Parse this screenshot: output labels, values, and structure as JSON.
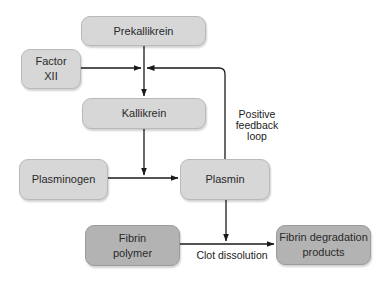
{
  "diagram": {
    "nodes": [
      {
        "id": "prekallikrein",
        "label": "Prekallikrein",
        "shade": "light"
      },
      {
        "id": "factor_xii",
        "label_line1": "Factor",
        "label_line2": "XII",
        "shade": "light"
      },
      {
        "id": "kallikrein",
        "label": "Kallikrein",
        "shade": "light"
      },
      {
        "id": "plasminogen",
        "label": "Plasminogen",
        "shade": "light"
      },
      {
        "id": "plasmin",
        "label": "Plasmin",
        "shade": "light"
      },
      {
        "id": "fibrin_polymer",
        "label_line1": "Fibrin",
        "label_line2": "polymer",
        "shade": "dark"
      },
      {
        "id": "fibrin_degradation",
        "label_line1": "Fibrin degradation",
        "label_line2": "products",
        "shade": "dark"
      }
    ],
    "edge_labels": {
      "feedback_line1": "Positive",
      "feedback_line2": "feedback",
      "feedback_line3": "loop",
      "clot_dissolution": "Clot dissolution"
    },
    "edges": [
      {
        "from": "prekallikrein",
        "to": "kallikrein"
      },
      {
        "from": "factor_xii",
        "to": "prekallikrein->kallikrein"
      },
      {
        "from": "plasmin",
        "to": "prekallikrein->kallikrein",
        "label": "Positive feedback loop"
      },
      {
        "from": "kallikrein",
        "to": "plasminogen->plasmin"
      },
      {
        "from": "plasminogen",
        "to": "plasmin"
      },
      {
        "from": "plasmin",
        "to": "fibrin_polymer->fibrin_degradation"
      },
      {
        "from": "fibrin_polymer",
        "to": "fibrin_degradation",
        "label": "Clot dissolution"
      }
    ],
    "colors": {
      "light_box": "#d7d7d7",
      "dark_box": "#b3b3b3",
      "line": "#1a1a1a"
    }
  }
}
